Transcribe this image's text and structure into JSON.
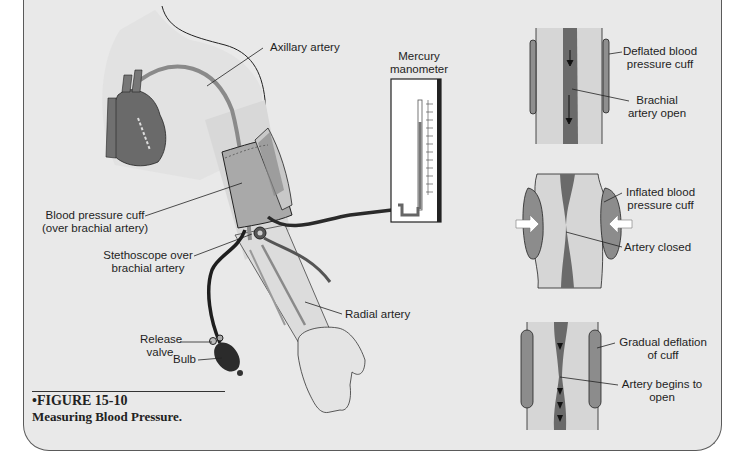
{
  "figure": {
    "number": "•FIGURE 15-10",
    "title": "Measuring Blood Pressure."
  },
  "labels": {
    "axillary_artery": "Axillary artery",
    "manometer_line1": "Mercury",
    "manometer_line2": "manometer",
    "cuff_line1": "Blood pressure cuff",
    "cuff_line2": "(over brachial artery)",
    "stethoscope_line1": "Stethoscope over",
    "stethoscope_line2": "brachial artery",
    "radial_artery": "Radial artery",
    "release_line1": "Release",
    "release_line2": "valve",
    "bulb": "Bulb"
  },
  "panels": [
    {
      "label_a1": "Deflated blood",
      "label_a2": "pressure cuff",
      "label_b1": "Brachial",
      "label_b2": "artery open"
    },
    {
      "label_a1": "Inflated blood",
      "label_a2": "pressure cuff",
      "label_b1": "Artery closed"
    },
    {
      "label_a1": "Gradual deflation",
      "label_a2": "of cuff",
      "label_b1": "Artery begins to",
      "label_b2": "open"
    }
  ],
  "colors": {
    "background": "#e9e9e9",
    "artery": "#6e6e6e",
    "cuff": "#8c8c8c",
    "skin": "#dcdcdc",
    "tube": "#2a2a2a"
  }
}
